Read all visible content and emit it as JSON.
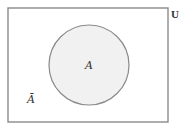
{
  "diagram": {
    "type": "venn",
    "universe": {
      "label": "U",
      "rect": {
        "x": 8,
        "y": 8,
        "width": 160,
        "height": 114
      },
      "stroke": "#8a8a8a",
      "fill": "#ffffff"
    },
    "set": {
      "label": "A",
      "circle": {
        "cx": 89,
        "cy": 65,
        "r": 40
      },
      "stroke": "#8a8a8a",
      "fill": "#f1f1f1"
    },
    "complement": {
      "label": "Ā",
      "position": {
        "x": 30,
        "y": 101
      }
    }
  }
}
